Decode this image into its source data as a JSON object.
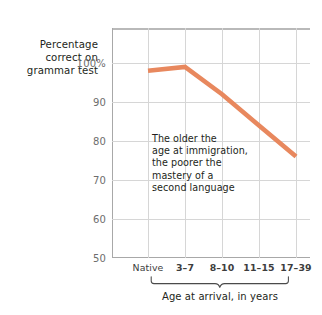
{
  "chart_data": {
    "type": "line",
    "title": "",
    "subtitle": "",
    "xlabel": "Age at arrival, in years",
    "ylabel": "Percentage correct on grammar test",
    "ylabel_lines": [
      "Percentage",
      "correct on",
      "grammar test"
    ],
    "categories": [
      "Native",
      "3–7",
      "8–10",
      "11–15",
      "17–39"
    ],
    "values": [
      98,
      99,
      92,
      84,
      76
    ],
    "series": [
      {
        "name": "Percentage correct on grammar test",
        "values": [
          98,
          99,
          92,
          84,
          76
        ],
        "color": "#E8885E"
      }
    ],
    "ylim": [
      50,
      104
    ],
    "yticks": [
      100,
      90,
      80,
      70,
      60,
      50
    ],
    "ytick_labels": [
      "100%",
      "90",
      "80",
      "70",
      "60",
      "50"
    ],
    "grid": "both",
    "legend": "none",
    "annotations": [
      {
        "text": "The older the age at immigration, the poorer the mastery of a second language",
        "lines": [
          "The older the",
          "age at immigration,",
          "the poorer the",
          "mastery of a",
          "second language"
        ]
      }
    ],
    "axis_bracket": {
      "label": "Age at arrival, in years",
      "spans": [
        "3–7",
        "8–10",
        "11–15",
        "17–39"
      ]
    }
  },
  "colors": {
    "line": "#E8885E",
    "grid": "#D6D6D6",
    "axis": "#A8A8A8",
    "top_rule": "#B9B9B9",
    "tick_text": "#6D6D6D",
    "label_text": "#231F20",
    "background": "#FFFFFF"
  }
}
